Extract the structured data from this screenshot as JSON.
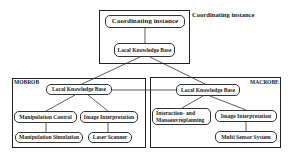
{
  "diagram": {
    "top": {
      "side_label": "Coordinating instance",
      "coordinator": "Coordinating instance",
      "knowledge_base": "Local Knowledge Base"
    },
    "left": {
      "title": "MOBROB",
      "knowledge_base": "Local Knowledge Base",
      "nodes": [
        "Manipulation Control",
        "Image Interpretation",
        "Manipulation Simulation",
        "Laser Scanner"
      ]
    },
    "right": {
      "title": "MACROBE",
      "knowledge_base": "Local Knowledge Base",
      "nodes": [
        "Interaction- and",
        "Manoeuvreplanning",
        "Image Interpretation",
        "Multi Sensor System"
      ]
    },
    "colors": {
      "stroke": "#222222",
      "background": "#ffffff"
    }
  }
}
